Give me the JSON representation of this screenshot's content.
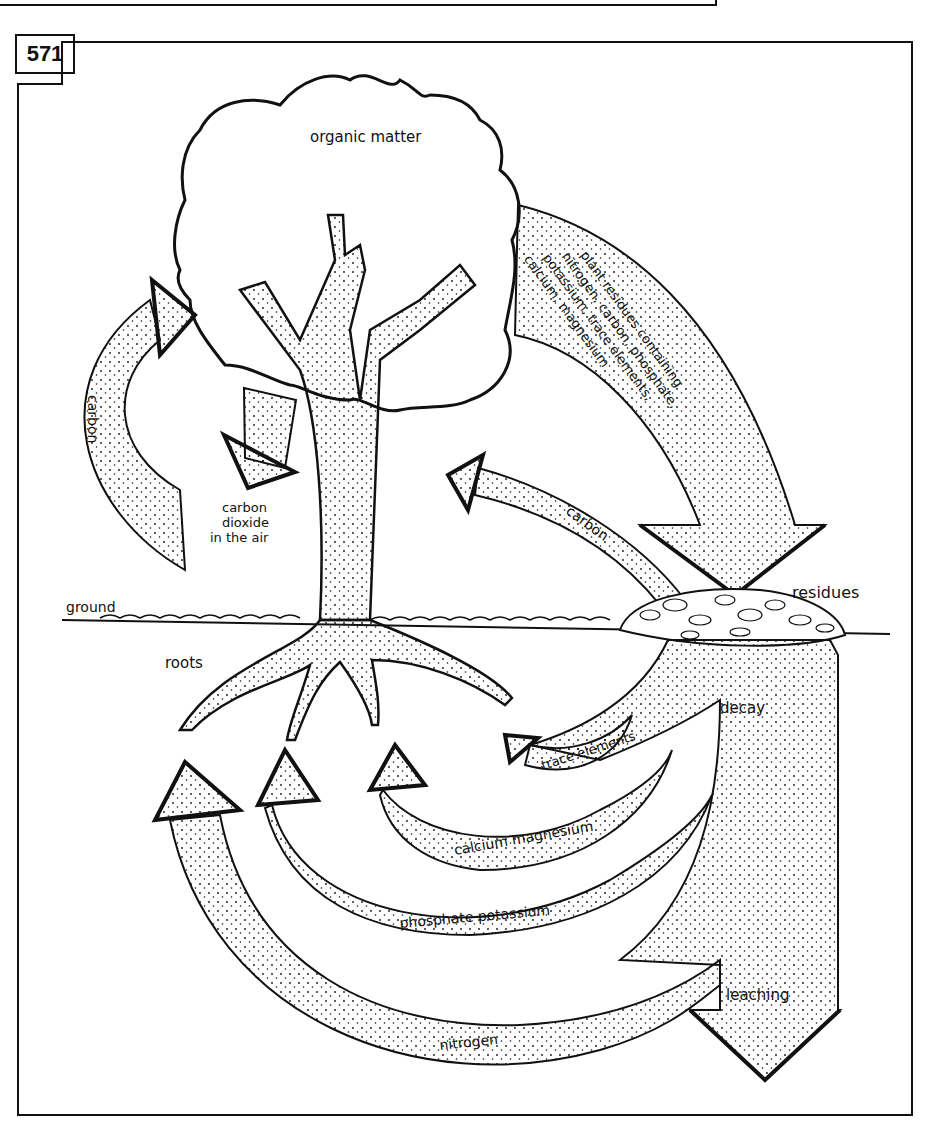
{
  "figure": {
    "number": "571"
  },
  "labels": {
    "organic_matter": "organic matter",
    "plant_residues_line1": "plant residues containing",
    "plant_residues_line2": "nitrogen, carbon, phosphate,",
    "plant_residues_line3": "potassium, trace elements,",
    "plant_residues_line4": "calcium, magnesium",
    "carbon_left": "carbon",
    "co2_line1": "carbon",
    "co2_line2": "dioxide",
    "co2_line3": "in the air",
    "carbon_right": "carbon",
    "residues": "residues",
    "ground": "ground",
    "roots": "roots",
    "decay": "decay",
    "trace_elements": "trace elements",
    "calcium_magnesium": "calcium magnesium",
    "phosphate_potassium": "phosphate potassium",
    "nitrogen": "nitrogen",
    "leaching": "leaching"
  },
  "colors": {
    "ink": "#111111",
    "paper": "#ffffff"
  }
}
